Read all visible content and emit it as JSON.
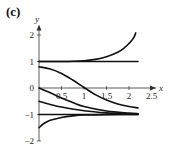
{
  "panel_label": "(c)",
  "chart_data": {
    "type": "line",
    "title": "(c)",
    "xlabel": "x",
    "ylabel": "y",
    "xlim": [
      0,
      2.6
    ],
    "ylim": [
      -2,
      2.4
    ],
    "x_ticks": [
      "0.5",
      "1",
      "1.5",
      "2",
      "2.5"
    ],
    "y_ticks": [
      "2",
      "1",
      "0",
      "-1",
      "-2"
    ],
    "grid": false,
    "legend": null,
    "series": [
      {
        "name": "curve from y(0)=1 rising",
        "x": [
          0,
          0.5,
          1.0,
          1.25,
          1.5,
          1.75,
          1.9,
          2.0,
          2.1,
          2.15
        ],
        "y": [
          1.0,
          1.0,
          1.03,
          1.08,
          1.18,
          1.35,
          1.52,
          1.68,
          1.88,
          2.08
        ]
      },
      {
        "name": "equilibrium y=1",
        "x": [
          0,
          2.2
        ],
        "y": [
          1,
          1
        ]
      },
      {
        "name": "curve from y(0)=0.8",
        "x": [
          0,
          0.25,
          0.5,
          0.75,
          1.0,
          1.25,
          1.5,
          1.75,
          2.0,
          2.2
        ],
        "y": [
          0.8,
          0.72,
          0.55,
          0.3,
          0.02,
          -0.25,
          -0.45,
          -0.6,
          -0.7,
          -0.75
        ]
      },
      {
        "name": "curve from y(0)=0",
        "x": [
          0,
          0.25,
          0.5,
          0.75,
          1.0,
          1.5,
          2.0,
          2.2
        ],
        "y": [
          0,
          -0.18,
          -0.38,
          -0.55,
          -0.7,
          -0.87,
          -0.95,
          -0.97
        ]
      },
      {
        "name": "curve from y(0)=-0.5",
        "x": [
          0,
          0.25,
          0.5,
          1.0,
          1.5,
          2.0,
          2.2
        ],
        "y": [
          -0.5,
          -0.62,
          -0.72,
          -0.86,
          -0.94,
          -0.98,
          -0.99
        ]
      },
      {
        "name": "equilibrium y=-1",
        "x": [
          0,
          2.2
        ],
        "y": [
          -1,
          -1
        ]
      },
      {
        "name": "curve from y(0)=-1.5",
        "x": [
          0,
          0.1,
          0.25,
          0.5,
          0.75,
          1.0,
          1.5,
          2.2
        ],
        "y": [
          -1.5,
          -1.35,
          -1.22,
          -1.11,
          -1.05,
          -1.02,
          -1.005,
          -1.0
        ]
      }
    ]
  }
}
